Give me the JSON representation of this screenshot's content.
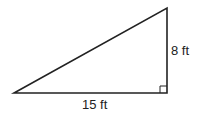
{
  "diagram": {
    "type": "right-triangle",
    "labels": {
      "vertical_leg": "8 ft",
      "horizontal_leg": "15 ft"
    },
    "right_angle_marker": "bottom-right",
    "stroke_color": "#222222"
  }
}
